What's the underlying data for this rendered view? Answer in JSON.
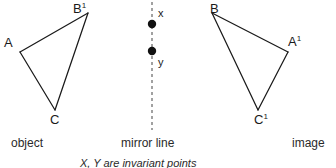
{
  "figure": {
    "title_footnote": "X, Y are invariant points",
    "captions": {
      "left": "object",
      "center": "mirror line",
      "right": "image"
    },
    "stroke_color": "#1a1a1a",
    "mirror_color": "#555555",
    "background_color": "#ffffff",
    "vertices": [
      {
        "id": "A",
        "label": "A",
        "sup": "",
        "x": 20,
        "y": 52
      },
      {
        "id": "B1",
        "label": "B",
        "sup": "1",
        "x": 88,
        "y": 13
      },
      {
        "id": "C",
        "label": "C",
        "sup": "",
        "x": 55,
        "y": 110
      },
      {
        "id": "A1",
        "label": "A",
        "sup": "1",
        "x": 288,
        "y": 52
      },
      {
        "id": "B",
        "label": "B",
        "sup": "",
        "x": 212,
        "y": 13
      },
      {
        "id": "C1",
        "label": "C",
        "sup": "1",
        "x": 258,
        "y": 110
      }
    ],
    "invariant_points": [
      {
        "id": "x",
        "label": "x",
        "x": 152,
        "y": 24
      },
      {
        "id": "y",
        "label": "y",
        "x": 152,
        "y": 51
      }
    ],
    "mirror_line": {
      "x": 152,
      "y_top": 2,
      "y_bottom": 130
    },
    "object_triangle_path": "M 20 52 L 88 13 L 55 110 Z",
    "image_triangle_path": "M 288 52 L 212 13 L 258 110 Z",
    "object_edges": [
      {
        "from": "A",
        "to": "B1"
      },
      {
        "from": "B1",
        "to": "C"
      },
      {
        "from": "C",
        "to": "A"
      }
    ],
    "image_edges": [
      {
        "from": "A1",
        "to": "B"
      },
      {
        "from": "B",
        "to": "C1"
      },
      {
        "from": "C1",
        "to": "A1"
      }
    ]
  }
}
